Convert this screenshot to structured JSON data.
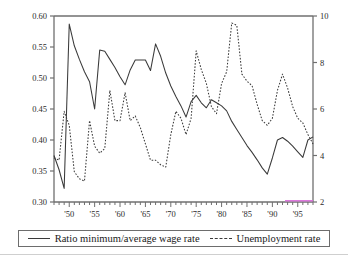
{
  "chart_data": {
    "type": "line",
    "title": "",
    "xlabel": "",
    "grid": false,
    "legend_position": "bottom",
    "x_tick_labels": [
      "'50",
      "'55",
      "'60",
      "'65",
      "'70",
      "'75",
      "'80",
      "'85",
      "'90",
      "'95"
    ],
    "x_tick_years": [
      1950,
      1955,
      1960,
      1965,
      1970,
      1975,
      1980,
      1985,
      1990,
      1995
    ],
    "xlim": [
      1947,
      1998
    ],
    "minor_tick_interval_years": 1,
    "axes": [
      {
        "side": "left",
        "ylabel": "Ratio minimum/average wage rate",
        "ylim": [
          0.3,
          0.6
        ],
        "tick_labels": [
          "0.30",
          "0.35",
          "0.40",
          "0.45",
          "0.50",
          "0.55",
          "0.60"
        ],
        "tick_values": [
          0.3,
          0.35,
          0.4,
          0.45,
          0.5,
          0.55,
          0.6
        ]
      },
      {
        "side": "right",
        "ylabel": "Unemployment rate",
        "ylim": [
          2,
          10
        ],
        "tick_labels": [
          "2",
          "4",
          "6",
          "8",
          "10"
        ],
        "tick_values": [
          2,
          4,
          6,
          8,
          10
        ]
      }
    ],
    "series": [
      {
        "name": "Ratio minimum/average wage rate",
        "style": "solid",
        "axis": "left",
        "color": "#3a3a3a",
        "x": [
          1947,
          1948,
          1949,
          1950,
          1951,
          1952,
          1953,
          1954,
          1955,
          1956,
          1957,
          1958,
          1959,
          1960,
          1961,
          1962,
          1963,
          1964,
          1965,
          1966,
          1967,
          1968,
          1969,
          1970,
          1971,
          1972,
          1973,
          1974,
          1975,
          1976,
          1977,
          1978,
          1979,
          1980,
          1981,
          1982,
          1983,
          1984,
          1985,
          1986,
          1987,
          1988,
          1989,
          1990,
          1991,
          1992,
          1993,
          1994,
          1995,
          1996,
          1997,
          1998
        ],
        "values": [
          0.375,
          0.352,
          0.322,
          0.587,
          0.552,
          0.53,
          0.51,
          0.494,
          0.45,
          0.545,
          0.543,
          0.53,
          0.517,
          0.502,
          0.489,
          0.513,
          0.529,
          0.529,
          0.529,
          0.512,
          0.555,
          0.535,
          0.508,
          0.487,
          0.47,
          0.455,
          0.437,
          0.462,
          0.472,
          0.46,
          0.452,
          0.465,
          0.46,
          0.455,
          0.447,
          0.43,
          0.417,
          0.404,
          0.391,
          0.38,
          0.368,
          0.355,
          0.345,
          0.371,
          0.4,
          0.404,
          0.398,
          0.39,
          0.381,
          0.372,
          0.4,
          0.405
        ]
      },
      {
        "name": "Unemployment rate",
        "style": "dashed",
        "axis": "right",
        "color": "#3a3a3a",
        "x": [
          1947,
          1948,
          1949,
          1950,
          1951,
          1952,
          1953,
          1954,
          1955,
          1956,
          1957,
          1958,
          1959,
          1960,
          1961,
          1962,
          1963,
          1964,
          1965,
          1966,
          1967,
          1968,
          1969,
          1970,
          1971,
          1972,
          1973,
          1974,
          1975,
          1976,
          1977,
          1978,
          1979,
          1980,
          1981,
          1982,
          1983,
          1984,
          1985,
          1986,
          1987,
          1988,
          1989,
          1990,
          1991,
          1992,
          1993,
          1994,
          1995,
          1996,
          1997,
          1998
        ],
        "values": [
          3.9,
          3.8,
          5.9,
          5.3,
          3.3,
          3.0,
          2.9,
          5.5,
          4.4,
          4.1,
          4.3,
          6.8,
          5.5,
          5.5,
          6.7,
          5.5,
          5.7,
          5.2,
          4.5,
          3.8,
          3.8,
          3.6,
          3.5,
          4.9,
          5.9,
          5.6,
          4.9,
          5.6,
          8.5,
          7.7,
          7.1,
          6.1,
          5.8,
          7.1,
          7.6,
          9.7,
          9.6,
          7.5,
          7.2,
          7.0,
          6.2,
          5.5,
          5.3,
          5.6,
          6.8,
          7.5,
          6.9,
          6.1,
          5.6,
          5.4,
          4.9,
          4.5
        ]
      }
    ]
  },
  "legend": {
    "entries": [
      {
        "label": "Ratio minimum/average wage rate",
        "style": "solid"
      },
      {
        "label": "Unemployment rate",
        "style": "dashed"
      }
    ]
  }
}
